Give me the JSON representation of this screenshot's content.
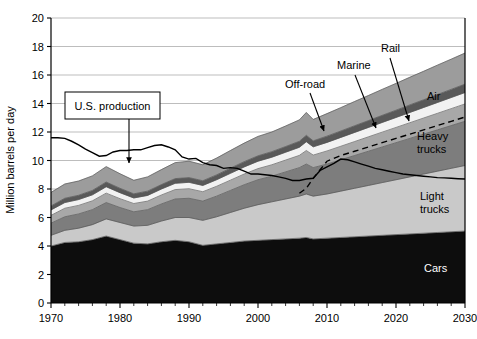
{
  "chart_data": {
    "type": "area",
    "title": "",
    "xlabel": "",
    "ylabel": "Million barrels per day",
    "xlim": [
      1970,
      2030
    ],
    "ylim": [
      0,
      20
    ],
    "xticks": [
      1970,
      1980,
      1990,
      2000,
      2010,
      2020,
      2030
    ],
    "yticks": [
      0,
      2,
      4,
      6,
      8,
      10,
      12,
      14,
      16,
      18,
      20
    ],
    "grid": true,
    "legend_position": "inline-labels",
    "stacked": true,
    "x": [
      1970,
      1972,
      1974,
      1976,
      1978,
      1980,
      1982,
      1984,
      1986,
      1988,
      1990,
      1992,
      1994,
      1996,
      1998,
      2000,
      2002,
      2004,
      2006,
      2007,
      2008,
      2010,
      2012,
      2014,
      2016,
      2018,
      2020,
      2022,
      2024,
      2026,
      2028,
      2030
    ],
    "series": [
      {
        "name": "Cars",
        "color": "#0d0d0d",
        "label_color": "#ffffff",
        "values": [
          4.0,
          4.25,
          4.3,
          4.45,
          4.7,
          4.45,
          4.2,
          4.15,
          4.3,
          4.4,
          4.3,
          4.05,
          4.15,
          4.25,
          4.35,
          4.4,
          4.45,
          4.5,
          4.55,
          4.6,
          4.5,
          4.55,
          4.6,
          4.65,
          4.7,
          4.75,
          4.8,
          4.85,
          4.9,
          4.95,
          5.0,
          5.05
        ]
      },
      {
        "name": "Light trucks",
        "color": "#c9c9c9",
        "label_color": "#000000",
        "values": [
          0.75,
          0.85,
          0.95,
          1.05,
          1.2,
          1.2,
          1.2,
          1.3,
          1.45,
          1.6,
          1.7,
          1.75,
          1.9,
          2.1,
          2.3,
          2.5,
          2.65,
          2.8,
          2.95,
          3.05,
          3.0,
          3.1,
          3.25,
          3.4,
          3.55,
          3.7,
          3.85,
          4.0,
          4.15,
          4.3,
          4.45,
          4.6
        ]
      },
      {
        "name": "Heavy trucks",
        "color": "#7d7d7d",
        "label_color": "#000000",
        "values": [
          0.85,
          0.95,
          1.0,
          1.05,
          1.15,
          1.05,
          1.0,
          1.1,
          1.2,
          1.3,
          1.35,
          1.35,
          1.45,
          1.55,
          1.65,
          1.75,
          1.8,
          1.9,
          2.0,
          2.1,
          2.0,
          2.1,
          2.2,
          2.3,
          2.4,
          2.5,
          2.6,
          2.7,
          2.8,
          2.9,
          3.0,
          3.1
        ]
      },
      {
        "name": "Off-road",
        "color": "#a8a8a8",
        "label_color": "#000000",
        "values": [
          0.55,
          0.6,
          0.6,
          0.62,
          0.66,
          0.62,
          0.58,
          0.6,
          0.63,
          0.66,
          0.67,
          0.66,
          0.69,
          0.72,
          0.75,
          0.78,
          0.8,
          0.83,
          0.86,
          0.95,
          0.88,
          0.92,
          0.95,
          0.98,
          1.01,
          1.04,
          1.07,
          1.1,
          1.13,
          1.16,
          1.19,
          1.22
        ]
      },
      {
        "name": "Marine",
        "color": "#f2f2f2",
        "label_color": "#000000",
        "values": [
          0.38,
          0.4,
          0.41,
          0.42,
          0.45,
          0.42,
          0.39,
          0.4,
          0.42,
          0.44,
          0.45,
          0.44,
          0.46,
          0.48,
          0.5,
          0.52,
          0.53,
          0.55,
          0.57,
          0.62,
          0.58,
          0.6,
          0.62,
          0.64,
          0.66,
          0.68,
          0.7,
          0.72,
          0.74,
          0.76,
          0.78,
          0.8
        ]
      },
      {
        "name": "Rail",
        "color": "#595959",
        "label_color": "#000000",
        "values": [
          0.28,
          0.3,
          0.3,
          0.31,
          0.33,
          0.31,
          0.29,
          0.3,
          0.31,
          0.33,
          0.33,
          0.33,
          0.34,
          0.36,
          0.37,
          0.38,
          0.39,
          0.4,
          0.42,
          0.45,
          0.42,
          0.44,
          0.45,
          0.47,
          0.48,
          0.5,
          0.51,
          0.53,
          0.54,
          0.56,
          0.57,
          0.59
        ]
      },
      {
        "name": "Air",
        "color": "#9c9c9c",
        "label_color": "#000000",
        "values": [
          0.95,
          1.0,
          1.0,
          1.02,
          1.08,
          1.02,
          0.95,
          1.0,
          1.05,
          1.12,
          1.15,
          1.12,
          1.18,
          1.24,
          1.3,
          1.36,
          1.38,
          1.44,
          1.5,
          1.6,
          1.5,
          1.58,
          1.64,
          1.7,
          1.76,
          1.82,
          1.88,
          1.94,
          2.0,
          2.06,
          2.12,
          2.18
        ]
      }
    ],
    "lines": [
      {
        "name": "U.S. production",
        "style": "solid",
        "color": "#000000",
        "x": [
          1970,
          1971,
          1972,
          1973,
          1974,
          1975,
          1976,
          1977,
          1978,
          1979,
          1980,
          1981,
          1982,
          1983,
          1984,
          1985,
          1986,
          1987,
          1988,
          1989,
          1990,
          1991,
          1992,
          1993,
          1994,
          1995,
          1996,
          1997,
          1998,
          1999,
          2000,
          2001,
          2002,
          2003,
          2004,
          2005,
          2006,
          2007,
          2008,
          2009,
          2010,
          2011,
          2012,
          2013,
          2014,
          2015,
          2016,
          2017,
          2018,
          2019,
          2020,
          2021,
          2022,
          2023,
          2024,
          2025,
          2026,
          2027,
          2028,
          2029,
          2030
        ],
        "y": [
          11.6,
          11.6,
          11.55,
          11.35,
          11.1,
          10.8,
          10.55,
          10.3,
          10.35,
          10.6,
          10.7,
          10.7,
          10.75,
          10.75,
          10.9,
          11.05,
          11.1,
          10.95,
          10.75,
          10.25,
          10.1,
          10.15,
          9.85,
          9.7,
          9.65,
          9.45,
          9.5,
          9.45,
          9.25,
          9.05,
          9.05,
          9.0,
          8.95,
          8.85,
          8.75,
          8.6,
          8.6,
          8.7,
          8.75,
          9.3,
          9.55,
          9.8,
          10.1,
          10.05,
          9.9,
          9.75,
          9.6,
          9.45,
          9.35,
          9.25,
          9.15,
          9.05,
          9.0,
          8.95,
          8.9,
          8.85,
          8.8,
          8.78,
          8.75,
          8.72,
          8.7
        ]
      },
      {
        "name": "dashed-projection",
        "style": "dashed",
        "color": "#000000",
        "x": [
          2006,
          2007,
          2008,
          2010,
          2012,
          2014,
          2016,
          2018,
          2020,
          2022,
          2024,
          2026,
          2028,
          2030
        ],
        "y": [
          7.7,
          8.05,
          8.75,
          9.95,
          10.35,
          10.65,
          10.95,
          11.25,
          11.55,
          11.85,
          12.15,
          12.45,
          12.75,
          13.05
        ]
      }
    ],
    "annotations": [
      {
        "label": "U.S. production",
        "type": "boxed",
        "box_x": 65,
        "box_y": 92,
        "box_w": 95,
        "box_h": 27,
        "arrow_to_x": 129,
        "arrow_to_y": 163
      },
      {
        "label": "Off-road",
        "type": "arrow",
        "text_x": 285,
        "text_y": 88,
        "arrow_from_x": 310,
        "arrow_from_y": 93,
        "arrow_to_x": 324,
        "arrow_to_y": 131
      },
      {
        "label": "Marine",
        "type": "arrow",
        "text_x": 337,
        "text_y": 69,
        "arrow_from_x": 355,
        "arrow_from_y": 75,
        "arrow_to_x": 376,
        "arrow_to_y": 128
      },
      {
        "label": "Rail",
        "type": "arrow",
        "text_x": 381,
        "text_y": 52,
        "arrow_from_x": 390,
        "arrow_from_y": 58,
        "arrow_to_x": 409,
        "arrow_to_y": 121
      },
      {
        "label": "Air",
        "type": "inline",
        "text_x": 427,
        "text_y": 100
      },
      {
        "label": "Heavy",
        "type": "inline",
        "text_x": 417,
        "text_y": 140
      },
      {
        "label": "trucks",
        "type": "inline",
        "text_x": 417,
        "text_y": 153
      },
      {
        "label": "Light",
        "type": "inline",
        "text_x": 420,
        "text_y": 200
      },
      {
        "label": "trucks",
        "type": "inline",
        "text_x": 420,
        "text_y": 213
      },
      {
        "label": "Cars",
        "type": "inline-white",
        "text_x": 424,
        "text_y": 272
      }
    ]
  },
  "axes": {
    "y_title": "Million barrels per day",
    "y_tick_labels": [
      "0",
      "2",
      "4",
      "6",
      "8",
      "10",
      "12",
      "14",
      "16",
      "18",
      "20"
    ],
    "x_tick_labels": [
      "1970",
      "1980",
      "1990",
      "2000",
      "2010",
      "2020",
      "2030"
    ]
  },
  "colors": {
    "background": "#ffffff",
    "axis": "#000000",
    "grid": "#b5b5b5",
    "cars": "#0d0d0d",
    "light_trucks": "#c9c9c9",
    "heavy_trucks": "#7d7d7d",
    "off_road": "#a8a8a8",
    "marine": "#f2f2f2",
    "rail": "#595959",
    "air": "#9c9c9c"
  }
}
